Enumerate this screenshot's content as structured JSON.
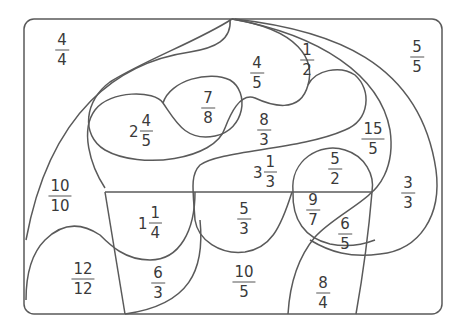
{
  "worksheet": {
    "type": "color-by-fraction puzzle",
    "line_color": "#5a5a5a",
    "text_color": "#3a3a3a",
    "regions": [
      {
        "id": "r1",
        "whole": "",
        "num": "4",
        "den": "4",
        "x": 62,
        "y": 50
      },
      {
        "id": "r2",
        "whole": "",
        "num": "5",
        "den": "5",
        "x": 417,
        "y": 57
      },
      {
        "id": "r3",
        "whole": "",
        "num": "1",
        "den": "2",
        "x": 307,
        "y": 60
      },
      {
        "id": "r4",
        "whole": "",
        "num": "4",
        "den": "5",
        "x": 257,
        "y": 73
      },
      {
        "id": "r5",
        "whole": "",
        "num": "7",
        "den": "8",
        "x": 208,
        "y": 108
      },
      {
        "id": "r6",
        "whole": "2",
        "num": "4",
        "den": "5",
        "x": 141,
        "y": 131
      },
      {
        "id": "r7",
        "whole": "",
        "num": "8",
        "den": "3",
        "x": 264,
        "y": 130
      },
      {
        "id": "r8",
        "whole": "",
        "num": "15",
        "den": "5",
        "x": 373,
        "y": 139
      },
      {
        "id": "r9",
        "whole": "3",
        "num": "1",
        "den": "3",
        "x": 265,
        "y": 172
      },
      {
        "id": "r10",
        "whole": "",
        "num": "5",
        "den": "2",
        "x": 335,
        "y": 169
      },
      {
        "id": "r11",
        "whole": "",
        "num": "3",
        "den": "3",
        "x": 408,
        "y": 193
      },
      {
        "id": "r12",
        "whole": "",
        "num": "10",
        "den": "10",
        "x": 60,
        "y": 196
      },
      {
        "id": "r13",
        "whole": "1",
        "num": "1",
        "den": "4",
        "x": 150,
        "y": 223
      },
      {
        "id": "r14",
        "whole": "",
        "num": "5",
        "den": "3",
        "x": 244,
        "y": 219
      },
      {
        "id": "r15",
        "whole": "",
        "num": "9",
        "den": "7",
        "x": 313,
        "y": 210
      },
      {
        "id": "r16",
        "whole": "",
        "num": "6",
        "den": "5",
        "x": 345,
        "y": 234
      },
      {
        "id": "r17",
        "whole": "",
        "num": "12",
        "den": "12",
        "x": 83,
        "y": 279
      },
      {
        "id": "r18",
        "whole": "",
        "num": "6",
        "den": "3",
        "x": 158,
        "y": 283
      },
      {
        "id": "r19",
        "whole": "",
        "num": "10",
        "den": "5",
        "x": 244,
        "y": 282
      },
      {
        "id": "r20",
        "whole": "",
        "num": "8",
        "den": "4",
        "x": 323,
        "y": 293
      }
    ]
  }
}
